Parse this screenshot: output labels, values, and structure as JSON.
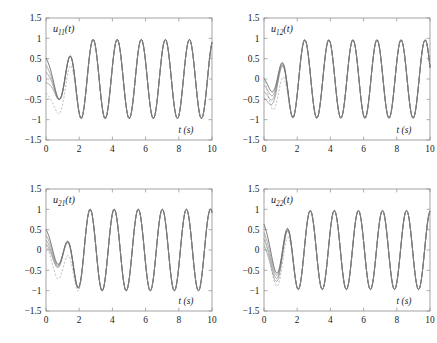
{
  "figure": {
    "background": "#ffffff",
    "axis_color": "#8d8d8d",
    "trace_color": "#6e6e6e",
    "trace_main_color": "#4a4a4a",
    "dashed_color": "#9a9a9a",
    "panel_count": 4
  },
  "panels": [
    {
      "id": "u11",
      "signal_label": "u",
      "signal_sub": "11",
      "signal_suffix": "(t)",
      "position": "top-left"
    },
    {
      "id": "u12",
      "signal_label": "u",
      "signal_sub": "12",
      "signal_suffix": "(t)",
      "position": "top-right"
    },
    {
      "id": "u21",
      "signal_label": "u",
      "signal_sub": "21",
      "signal_suffix": "(t)",
      "position": "bottom-left"
    },
    {
      "id": "u22",
      "signal_label": "u",
      "signal_sub": "22",
      "signal_suffix": "(t)",
      "position": "bottom-right"
    }
  ],
  "axes": {
    "xlabel": "t (s)",
    "xticks": [
      "0",
      "2",
      "4",
      "6",
      "8",
      "10"
    ],
    "yticks": [
      "1.5",
      "1",
      "0.5",
      "0",
      "-0.5",
      "-1",
      "-1.5"
    ],
    "xlim": [
      0,
      10
    ],
    "ylim": [
      -1.5,
      1.5
    ]
  },
  "chart_data": [
    {
      "type": "line",
      "title": "u11(t)",
      "xlabel": "t (s)",
      "ylabel": "",
      "xlim": [
        0,
        10
      ],
      "ylim": [
        -1.5,
        1.5
      ],
      "xticks": [
        0,
        2,
        4,
        6,
        8,
        10
      ],
      "yticks": [
        -1.5,
        -1,
        -0.5,
        0,
        0.5,
        1,
        1.5
      ],
      "grid": false,
      "legend": "none",
      "steady_state": {
        "amplitude": 0.97,
        "period": 1.45,
        "omega": 4.33,
        "phase_deg": 105,
        "offset": 0.0,
        "settling_time": 2.2
      },
      "series": [
        {
          "name": "adaptive-trace-1",
          "style": "solid",
          "start_value": 0.62,
          "transient_min": -0.58,
          "transient_min_time": 1.3
        },
        {
          "name": "adaptive-trace-2",
          "style": "solid",
          "start_value": 0.45,
          "transient_min": -0.54,
          "transient_min_time": 1.3
        },
        {
          "name": "adaptive-trace-3",
          "style": "solid",
          "start_value": 0.3,
          "transient_min": -0.5,
          "transient_min_time": 1.3
        },
        {
          "name": "adaptive-trace-4",
          "style": "solid",
          "start_value": 0.05,
          "transient_min": -0.46,
          "transient_min_time": 1.3
        },
        {
          "name": "reference-trace",
          "style": "dashed",
          "start_value": 0.0,
          "transient_min": -1.05,
          "transient_min_time": 1.35
        }
      ]
    },
    {
      "type": "line",
      "title": "u12(t)",
      "xlabel": "t (s)",
      "ylabel": "",
      "xlim": [
        0,
        10
      ],
      "ylim": [
        -1.5,
        1.5
      ],
      "xticks": [
        0,
        2,
        4,
        6,
        8,
        10
      ],
      "yticks": [
        -1.5,
        -1,
        -0.5,
        0,
        0.5,
        1,
        1.5
      ],
      "grid": false,
      "legend": "none",
      "steady_state": {
        "amplitude": 0.96,
        "period": 1.45,
        "omega": 4.33,
        "phase_deg": 200,
        "offset": 0.0,
        "settling_time": 1.9
      },
      "series": [
        {
          "name": "adaptive-trace-1",
          "style": "solid",
          "start_value": 0.18,
          "transient_min": -0.62,
          "transient_min_time": 0.85
        },
        {
          "name": "adaptive-trace-2",
          "style": "solid",
          "start_value": 0.08,
          "transient_min": -0.66,
          "transient_min_time": 0.85
        },
        {
          "name": "adaptive-trace-3",
          "style": "solid",
          "start_value": -0.02,
          "transient_min": -0.7,
          "transient_min_time": 0.85
        },
        {
          "name": "adaptive-trace-4",
          "style": "solid",
          "start_value": -0.12,
          "transient_min": -0.74,
          "transient_min_time": 0.85
        },
        {
          "name": "reference-trace",
          "style": "dashed",
          "start_value": 0.55,
          "transient_min": -1.02,
          "transient_min_time": 0.9
        }
      ]
    },
    {
      "type": "line",
      "title": "u21(t)",
      "xlabel": "t (s)",
      "ylabel": "",
      "xlim": [
        0,
        10
      ],
      "ylim": [
        -1.5,
        1.5
      ],
      "xticks": [
        0,
        2,
        4,
        6,
        8,
        10
      ],
      "yticks": [
        -1.5,
        -1,
        -0.5,
        0,
        0.5,
        1,
        1.5
      ],
      "grid": false,
      "legend": "none",
      "steady_state": {
        "amplitude": 1.0,
        "period": 1.45,
        "omega": 4.33,
        "phase_deg": 150,
        "offset": 0.0,
        "settling_time": 2.5
      },
      "series": [
        {
          "name": "adaptive-trace-1",
          "style": "solid",
          "start_value": 0.6,
          "transient_min": -0.7,
          "transient_min_time": 1.6
        },
        {
          "name": "adaptive-trace-2",
          "style": "solid",
          "start_value": 0.48,
          "transient_min": -0.68,
          "transient_min_time": 1.6
        },
        {
          "name": "adaptive-trace-3",
          "style": "solid",
          "start_value": 0.38,
          "transient_min": -0.66,
          "transient_min_time": 1.6
        },
        {
          "name": "adaptive-trace-4",
          "style": "solid",
          "start_value": 0.3,
          "transient_min": -0.64,
          "transient_min_time": 1.6
        },
        {
          "name": "reference-trace",
          "style": "dashed",
          "start_value": 0.42,
          "transient_min": -1.08,
          "transient_min_time": 1.65
        }
      ]
    },
    {
      "type": "line",
      "title": "u22(t)",
      "xlabel": "t (s)",
      "ylabel": "",
      "xlim": [
        0,
        10
      ],
      "ylim": [
        -1.5,
        1.5
      ],
      "xticks": [
        0,
        2,
        4,
        6,
        8,
        10
      ],
      "yticks": [
        -1.5,
        -1,
        -0.5,
        0,
        0.5,
        1,
        1.5
      ],
      "grid": false,
      "legend": "none",
      "steady_state": {
        "amplitude": 0.97,
        "period": 1.45,
        "omega": 4.33,
        "phase_deg": 118,
        "offset": 0.0,
        "settling_time": 2.1
      },
      "series": [
        {
          "name": "adaptive-trace-1",
          "style": "solid",
          "start_value": 0.78,
          "transient_min": -0.8,
          "transient_min_time": 1.2
        },
        {
          "name": "adaptive-trace-2",
          "style": "solid",
          "start_value": 0.62,
          "transient_min": -0.84,
          "transient_min_time": 1.2
        },
        {
          "name": "adaptive-trace-3",
          "style": "solid",
          "start_value": 0.5,
          "transient_min": -0.88,
          "transient_min_time": 1.2
        },
        {
          "name": "adaptive-trace-4",
          "style": "solid",
          "start_value": 0.4,
          "transient_min": -0.92,
          "transient_min_time": 1.2
        },
        {
          "name": "reference-trace",
          "style": "dashed",
          "start_value": 0.7,
          "transient_min": -1.0,
          "transient_min_time": 1.25
        }
      ]
    }
  ]
}
